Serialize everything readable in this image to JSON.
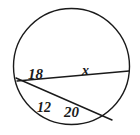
{
  "figure": {
    "background_color": "#ffffff",
    "stroke_color": "#1a1a1a",
    "label_color": "#1a1a1a",
    "circle": {
      "center_x": 71.5,
      "center_y": 66.5,
      "radius": 58,
      "stroke_width": 1.4
    },
    "chords": [
      {
        "name": "chord-18-20",
        "x1": 16,
        "y1": 78,
        "x2": 112,
        "y2": 120,
        "stroke_width": 1.4
      },
      {
        "name": "chord-12-x",
        "x1": 17,
        "y1": 81,
        "x2": 129,
        "y2": 71,
        "stroke_width": 1.4
      }
    ],
    "intersection": {
      "x": 58,
      "y": 97
    },
    "labels": [
      {
        "key": "seg_18",
        "text": "18"
      },
      {
        "key": "seg_x",
        "text": "x"
      },
      {
        "key": "seg_12",
        "text": "12"
      },
      {
        "key": "seg_20",
        "text": "20"
      }
    ],
    "values": {
      "seg_18": "18",
      "seg_x": "x",
      "seg_12": "12",
      "seg_20": "20"
    }
  }
}
